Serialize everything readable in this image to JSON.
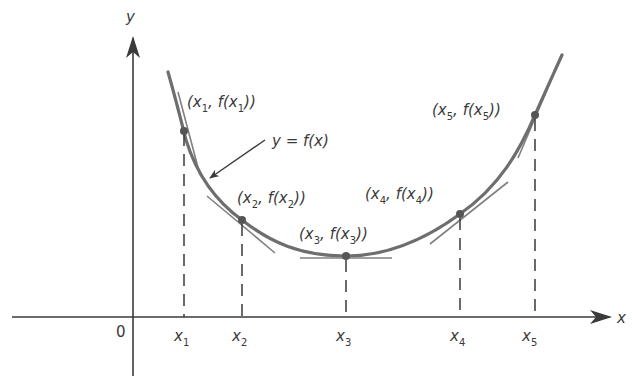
{
  "diagram": {
    "axes": {
      "x_label": "x",
      "y_label": "y",
      "origin_label": "0"
    },
    "curve_label": "y = f(x)",
    "points": [
      {
        "name": "x",
        "sub": "1",
        "tick_label": "x",
        "point_label_pre": "(x",
        "point_label_mid": ", f(x",
        "point_label_post": "))"
      },
      {
        "name": "x",
        "sub": "2",
        "tick_label": "x",
        "point_label_pre": "(x",
        "point_label_mid": ", f(x",
        "point_label_post": "))"
      },
      {
        "name": "x",
        "sub": "3",
        "tick_label": "x",
        "point_label_pre": "(x",
        "point_label_mid": ", f(x",
        "point_label_post": "))"
      },
      {
        "name": "x",
        "sub": "4",
        "tick_label": "x",
        "point_label_pre": "(x",
        "point_label_mid": ", f(x",
        "point_label_post": "))"
      },
      {
        "name": "x",
        "sub": "5",
        "tick_label": "x",
        "point_label_pre": "(x",
        "point_label_mid": ", f(x",
        "point_label_post": "))"
      }
    ],
    "colors": {
      "curve": "#6e6e6e",
      "axis": "#3a3a3a",
      "text": "#3a3a3a"
    }
  }
}
